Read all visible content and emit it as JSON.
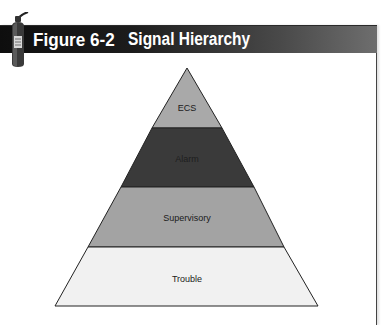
{
  "figure": {
    "number": "Figure 6-2",
    "title": "Signal Hierarchy",
    "icon": "fire-extinguisher-icon"
  },
  "diagram": {
    "type": "pyramid",
    "layers": [
      {
        "label": "ECS",
        "color": "#a9a9a9",
        "level": 1
      },
      {
        "label": "Alarm",
        "color": "#3a3a3a",
        "level": 2
      },
      {
        "label": "Supervisory",
        "color": "#a3a3a3",
        "level": 3
      },
      {
        "label": "Trouble",
        "color": "#f1f1f1",
        "level": 4
      }
    ]
  },
  "colors": {
    "header_dark": "#0e0e0e",
    "header_light": "#6e6e6e",
    "outline": "#222222"
  }
}
